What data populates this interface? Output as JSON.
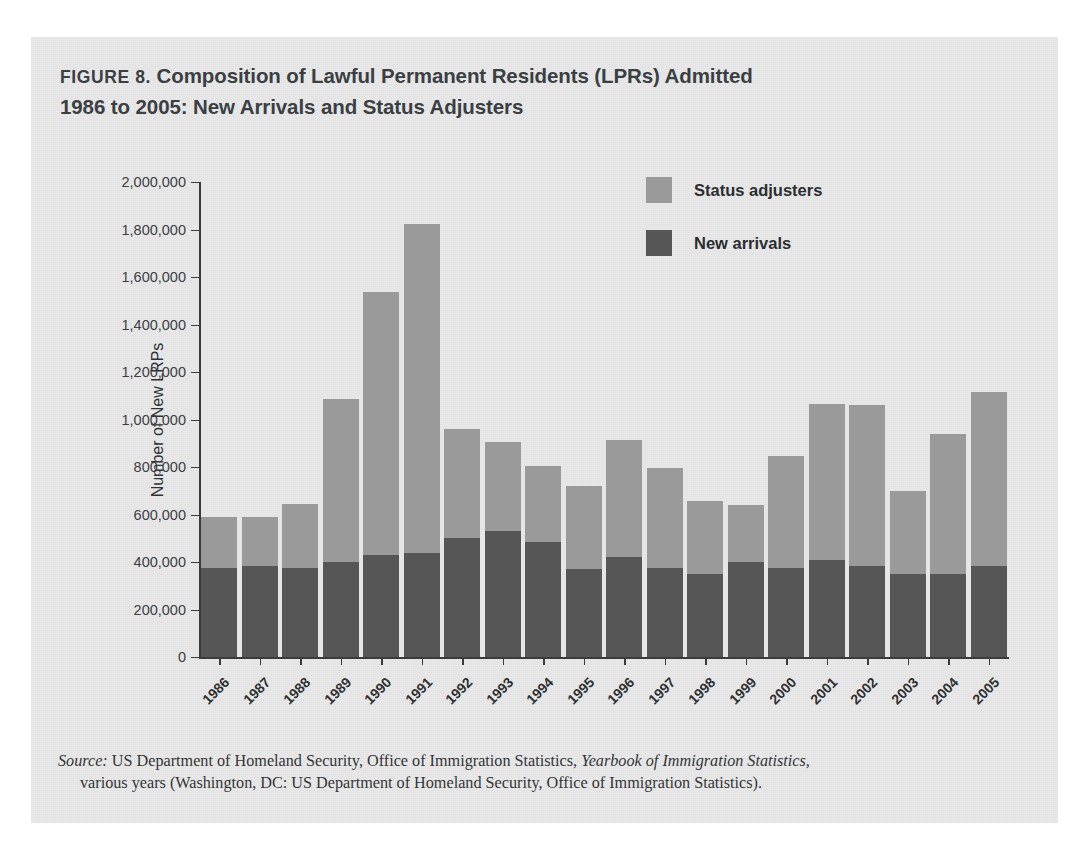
{
  "figure": {
    "label": "FIGURE 8.",
    "title_line1": "Composition of Lawful Permanent Residents (LPRs) Admitted",
    "title_line2": "1986 to 2005: New Arrivals and Status Adjusters"
  },
  "legend": {
    "position": "top-right",
    "items": [
      {
        "label": "Status adjusters",
        "color": "#9a9a9a"
      },
      {
        "label": "New arrivals",
        "color": "#565656"
      }
    ]
  },
  "source": {
    "lead": "Source:",
    "text_part1": " US Department of Homeland Security, Office of Immigration Statistics, ",
    "italic_title": "Yearbook of Immigration Statistics,",
    "text_part2": "various years (Washington, DC: US Department of Homeland Security, Office of Immigration Statistics)."
  },
  "chart_data": {
    "type": "bar",
    "stacked": true,
    "title": "FIGURE 8. Composition of Lawful Permanent Residents (LPRs) Admitted 1986 to 2005: New Arrivals and Status Adjusters",
    "xlabel": "",
    "ylabel": "Number of New LRPs",
    "categories": [
      "1986",
      "1987",
      "1988",
      "1989",
      "1990",
      "1991",
      "1992",
      "1993",
      "1994",
      "1995",
      "1996",
      "1997",
      "1998",
      "1999",
      "2000",
      "2001",
      "2002",
      "2003",
      "2004",
      "2005"
    ],
    "ytick_labels": [
      "0",
      "200,000",
      "400,000",
      "600,000",
      "800,000",
      "1,000,000",
      "1,200,000",
      "1,400,000",
      "1,600,000",
      "1,800,000",
      "2,000,000"
    ],
    "ytick_values": [
      0,
      200000,
      400000,
      600000,
      800000,
      1000000,
      1200000,
      1400000,
      1600000,
      1800000,
      2000000
    ],
    "ylim": [
      0,
      2000000
    ],
    "grid": false,
    "series": [
      {
        "name": "New arrivals",
        "color": "#565656",
        "values": [
          375000,
          385000,
          375000,
          400000,
          430000,
          440000,
          500000,
          530000,
          485000,
          370000,
          420000,
          375000,
          350000,
          400000,
          375000,
          410000,
          385000,
          350000,
          350000,
          385000
        ]
      },
      {
        "name": "Status adjusters",
        "color": "#9a9a9a",
        "values": [
          215000,
          205000,
          270000,
          685000,
          1105000,
          1385000,
          460000,
          375000,
          320000,
          350000,
          495000,
          420000,
          305000,
          240000,
          470000,
          655000,
          675000,
          350000,
          590000,
          730000
        ]
      }
    ],
    "totals": [
      590000,
      590000,
      645000,
      1085000,
      1535000,
      1825000,
      960000,
      905000,
      805000,
      720000,
      915000,
      795000,
      655000,
      640000,
      845000,
      1065000,
      1060000,
      700000,
      940000,
      1115000
    ]
  }
}
